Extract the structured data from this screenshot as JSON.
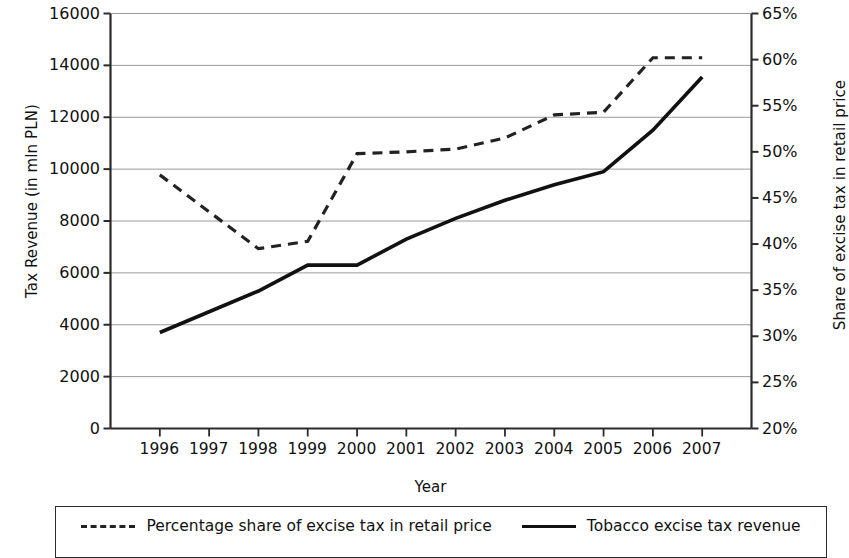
{
  "chart_data": {
    "type": "line",
    "title": "",
    "xlabel": "Year",
    "ylabel": "Tax Revenue (in mln PLN)",
    "ylabel_right": "Share of excise tax in retail price",
    "categories": [
      "1996",
      "1997",
      "1998",
      "1999",
      "2000",
      "2001",
      "2002",
      "2003",
      "2004",
      "2005",
      "2006",
      "2007"
    ],
    "ylim": [
      0,
      16000
    ],
    "ylim_right": [
      20,
      65
    ],
    "yticks": [
      "16000",
      "14000",
      "12000",
      "10000",
      "8000",
      "6000",
      "4000",
      "2000",
      "0"
    ],
    "ytick_values": [
      16000,
      14000,
      12000,
      10000,
      8000,
      6000,
      4000,
      2000,
      0
    ],
    "yticks_right": [
      "65%",
      "60%",
      "55%",
      "50%",
      "45%",
      "40%",
      "35%",
      "30%",
      "25%",
      "20%"
    ],
    "ytick_values_right": [
      65,
      60,
      55,
      50,
      45,
      40,
      35,
      30,
      25,
      20
    ],
    "grid": true,
    "legend_position": "bottom",
    "series": [
      {
        "name": "Percentage share of excise tax in retail price",
        "axis": "right",
        "style": "dashed",
        "color": "#222222",
        "values": [
          47.5,
          43.5,
          39.5,
          40.3,
          49.8,
          50.0,
          50.3,
          51.5,
          54.0,
          54.3,
          60.2,
          60.2
        ]
      },
      {
        "name": "Tobacco excise tax revenue",
        "axis": "left",
        "style": "solid",
        "color": "#111111",
        "values": [
          3700,
          4500,
          5300,
          6300,
          6300,
          7300,
          8100,
          8800,
          9400,
          9900,
          11500,
          13550
        ]
      }
    ]
  },
  "legend": {
    "items": [
      {
        "label": "Percentage share of excise tax in retail price",
        "style": "dashed"
      },
      {
        "label": "Tobacco excise tax revenue",
        "style": "solid"
      }
    ]
  },
  "colors": {
    "grid": "#9a9a9a",
    "axis": "#2b2b2b",
    "dashed_series": "#222222",
    "solid_series": "#111111",
    "background": "#ffffff"
  }
}
